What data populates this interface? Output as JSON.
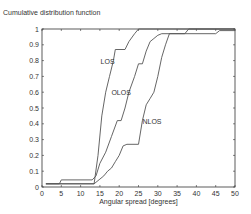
{
  "chart_data": {
    "type": "line",
    "title": "Cumulative distribution function",
    "xlabel": "Angular spread [degrees]",
    "ylabel": "",
    "xlim": [
      0,
      50
    ],
    "ylim": [
      0,
      1
    ],
    "xticks": [
      0,
      5,
      10,
      15,
      20,
      25,
      30,
      35,
      40,
      45,
      50
    ],
    "yticks": [
      0,
      0.1,
      0.2,
      0.3,
      0.4,
      0.5,
      0.6,
      0.7,
      0.8,
      0.9,
      1
    ],
    "grid": false,
    "legend": "inline labels",
    "series": [
      {
        "name": "LOS",
        "label_pos": [
          17,
          0.78
        ],
        "x": [
          1,
          13.5,
          14.5,
          15.5,
          16.5,
          17.5,
          18.5,
          19,
          21.5,
          22.5,
          24,
          25,
          50
        ],
        "y": [
          0.02,
          0.02,
          0.2,
          0.45,
          0.6,
          0.7,
          0.8,
          0.87,
          0.87,
          0.92,
          0.97,
          1.0,
          1.0
        ]
      },
      {
        "name": "OLOS",
        "label_pos": [
          20.5,
          0.58
        ],
        "x": [
          1,
          4.5,
          5,
          13,
          14,
          15,
          16.5,
          18,
          19.5,
          20.5,
          21.5,
          22.5,
          24,
          25,
          26,
          27,
          28,
          29,
          30,
          31,
          37,
          38,
          50
        ],
        "y": [
          0.02,
          0.02,
          0.045,
          0.045,
          0.07,
          0.15,
          0.22,
          0.32,
          0.42,
          0.42,
          0.5,
          0.6,
          0.7,
          0.78,
          0.78,
          0.86,
          0.92,
          0.94,
          0.96,
          0.97,
          0.97,
          1.0,
          1.0
        ]
      },
      {
        "name": "NLOS",
        "label_pos": [
          28.5,
          0.4
        ],
        "x": [
          1,
          13.5,
          15,
          16,
          17,
          18,
          19,
          20,
          21,
          22,
          25,
          26,
          27,
          28,
          29,
          30,
          31,
          32,
          33,
          45,
          46,
          50
        ],
        "y": [
          0.02,
          0.02,
          0.05,
          0.07,
          0.1,
          0.12,
          0.16,
          0.2,
          0.26,
          0.27,
          0.27,
          0.42,
          0.52,
          0.56,
          0.6,
          0.7,
          0.82,
          0.9,
          0.97,
          0.97,
          0.99,
          0.99
        ]
      }
    ]
  },
  "colors": {
    "line": "#555555",
    "axis": "#333333"
  }
}
